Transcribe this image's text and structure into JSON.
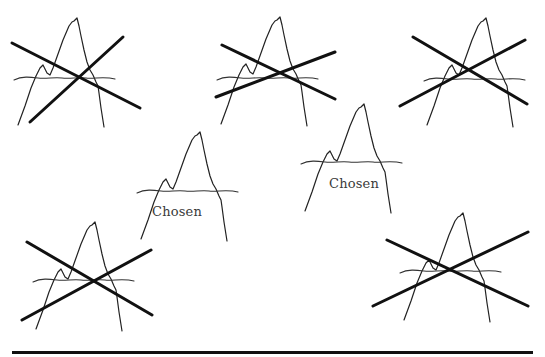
{
  "diagram": {
    "type": "figure-selection-illustration",
    "top_caption_fragment": "(cut-off line of text at top edge)",
    "chosen_label": "Chosen",
    "figures": [
      {
        "id": "fig-1",
        "position": "top-left",
        "status": "rejected",
        "crossed_out": true
      },
      {
        "id": "fig-2",
        "position": "top-center",
        "status": "rejected",
        "crossed_out": true
      },
      {
        "id": "fig-3",
        "position": "top-right",
        "status": "rejected",
        "crossed_out": true
      },
      {
        "id": "fig-4",
        "position": "middle-left",
        "status": "chosen",
        "crossed_out": false,
        "label": "Chosen"
      },
      {
        "id": "fig-5",
        "position": "middle-right",
        "status": "chosen",
        "crossed_out": false,
        "label": "Chosen"
      },
      {
        "id": "fig-6",
        "position": "bottom-left",
        "status": "rejected",
        "crossed_out": true
      },
      {
        "id": "fig-7",
        "position": "bottom-right",
        "status": "rejected",
        "crossed_out": true
      }
    ],
    "colors": {
      "stroke": "#222222",
      "cross": "#111111",
      "label": "#3a3a3a",
      "background": "#ffffff"
    }
  },
  "labels": {
    "chosen_1": "Chosen",
    "chosen_2": "Chosen"
  }
}
